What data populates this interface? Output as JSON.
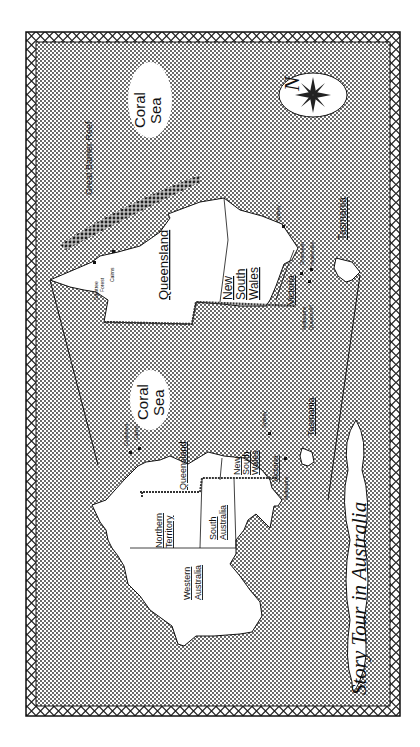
{
  "title": "Story Tour in Australia",
  "colors": {
    "ink": "#111111",
    "paper": "#ffffff",
    "sea_dot": "#222222",
    "reef_dot": "#333333"
  },
  "compass": {
    "icon": "compass-rose-icon",
    "north_label": "N"
  },
  "main_map": {
    "states": {
      "western_australia": "Western Australia",
      "northern_territory": "Northern Territory",
      "south_australia": "South Australia",
      "queensland": "Queensland",
      "new_south_wales": "New South Wales",
      "victoria": "Victoria",
      "tasmania": "Tasmania"
    },
    "sea": "Coral Sea",
    "cities": {
      "cooktown": "Cooktown",
      "cairns": "Cairns",
      "sydney": "Sydney",
      "melbourne": "Melbourne"
    }
  },
  "inset_map": {
    "states": {
      "queensland": "Queensland",
      "new_south_wales": "New South Wales",
      "victoria": "Victoria",
      "tasmania": "Tasmania"
    },
    "sea": "Coral Sea",
    "reef": "Great Barrier Reef",
    "cities": {
      "daintree": "Daintree Forest",
      "cairns": "Cairns",
      "sydney": "Sydney",
      "melbourne": "Melbourne",
      "queenscliff": "Queenscliff",
      "dromkeen": "Dromkeen",
      "healesville": "Healesville"
    }
  }
}
